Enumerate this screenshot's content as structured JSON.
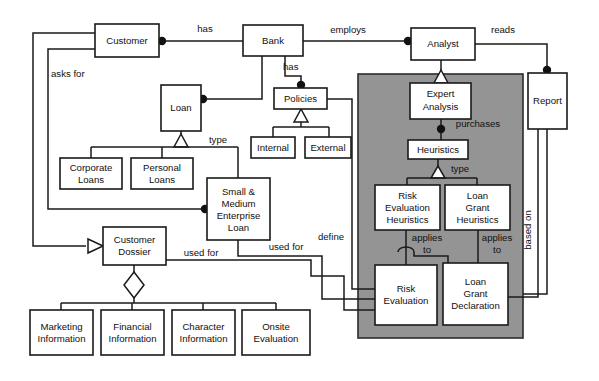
{
  "diagram": {
    "kind": "uml-class-diagram",
    "canvas": {
      "width": 599,
      "height": 381,
      "background": "#ffffff"
    },
    "colors": {
      "line": "#1a1a1a",
      "box_fill": "#ffffff",
      "grey_panel": "#949494",
      "shadow": "#8a8a8a"
    },
    "grey_panel": {
      "label": "expert-analysis-subsystem",
      "x": 358,
      "y": 74,
      "width": 165,
      "height": 264
    },
    "classes": [
      {
        "id": "customer",
        "label": "Customer",
        "lines": [
          "Customer"
        ],
        "x": 95,
        "y": 24,
        "w": 64,
        "h": 33
      },
      {
        "id": "bank",
        "label": "Bank",
        "lines": [
          "Bank"
        ],
        "x": 243,
        "y": 25,
        "w": 60,
        "h": 31
      },
      {
        "id": "analyst",
        "label": "Analyst",
        "lines": [
          "Analyst"
        ],
        "x": 411,
        "y": 28,
        "w": 64,
        "h": 32
      },
      {
        "id": "report",
        "label": "Report",
        "lines": [
          "Report"
        ],
        "x": 528,
        "y": 73,
        "w": 39,
        "h": 56
      },
      {
        "id": "loan",
        "label": "Loan",
        "lines": [
          "Loan"
        ],
        "x": 161,
        "y": 85,
        "w": 40,
        "h": 46
      },
      {
        "id": "policies",
        "label": "Policies",
        "lines": [
          "Policies"
        ],
        "x": 274,
        "y": 88,
        "w": 53,
        "h": 21
      },
      {
        "id": "internal",
        "label": "Internal",
        "lines": [
          "Internal"
        ],
        "x": 251,
        "y": 137,
        "w": 44,
        "h": 21
      },
      {
        "id": "external",
        "label": "External",
        "lines": [
          "External"
        ],
        "x": 305,
        "y": 137,
        "w": 46,
        "h": 21
      },
      {
        "id": "expert-analysis",
        "label": "Expert Analysis",
        "lines": [
          "Expert",
          "Analysis"
        ],
        "x": 410,
        "y": 83,
        "w": 61,
        "h": 36
      },
      {
        "id": "heuristics",
        "label": "Heuristics",
        "lines": [
          "Heuristics"
        ],
        "x": 408,
        "y": 140,
        "w": 60,
        "h": 19
      },
      {
        "id": "corporate-loans",
        "label": "Corporate Loans",
        "lines": [
          "Corporate",
          "Loans"
        ],
        "x": 60,
        "y": 158,
        "w": 62,
        "h": 31
      },
      {
        "id": "personal-loans",
        "label": "Personal Loans",
        "lines": [
          "Personal",
          "Loans"
        ],
        "x": 131,
        "y": 158,
        "w": 62,
        "h": 31
      },
      {
        "id": "sme-loan",
        "label": "Small & Medium Enterprise Loan",
        "lines": [
          "Small &",
          "Medium",
          "Enterprise",
          "Loan"
        ],
        "x": 207,
        "y": 178,
        "w": 63,
        "h": 62
      },
      {
        "id": "risk-eval-heuristics",
        "label": "Risk Evaluation Heuristics",
        "lines": [
          "Risk",
          "Evaluation",
          "Heuristics"
        ],
        "x": 375,
        "y": 185,
        "w": 65,
        "h": 45
      },
      {
        "id": "loan-grant-heuristics",
        "label": "Loan Grant Heuristics",
        "lines": [
          "Loan",
          "Grant",
          "Heuristics"
        ],
        "x": 445,
        "y": 185,
        "w": 65,
        "h": 45
      },
      {
        "id": "customer-dossier",
        "label": "Customer Dossier",
        "lines": [
          "Customer",
          "Dossier"
        ],
        "x": 103,
        "y": 227,
        "w": 63,
        "h": 38
      },
      {
        "id": "risk-evaluation",
        "label": "Risk Evaluation",
        "lines": [
          "Risk",
          "Evaluation"
        ],
        "x": 375,
        "y": 265,
        "w": 62,
        "h": 60
      },
      {
        "id": "loan-grant-declaration",
        "label": "Loan Grant Declaration",
        "lines": [
          "Loan",
          "Grant",
          "Declaration"
        ],
        "x": 443,
        "y": 263,
        "w": 65,
        "h": 62
      },
      {
        "id": "marketing-information",
        "label": "Marketing Information",
        "lines": [
          "Marketing",
          "Information"
        ],
        "x": 30,
        "y": 310,
        "w": 63,
        "h": 45
      },
      {
        "id": "financial-information",
        "label": "Financial Information",
        "lines": [
          "Financial",
          "Information"
        ],
        "x": 101,
        "y": 310,
        "w": 63,
        "h": 45
      },
      {
        "id": "character-information",
        "label": "Character Information",
        "lines": [
          "Character",
          "Information"
        ],
        "x": 172,
        "y": 310,
        "w": 63,
        "h": 45
      },
      {
        "id": "onsite-evaluation",
        "label": "Onsite Evaluation",
        "lines": [
          "Onsite",
          "Evaluation"
        ],
        "x": 242,
        "y": 310,
        "w": 68,
        "h": 45
      }
    ],
    "relationship_labels": [
      {
        "id": "has-customer-bank",
        "text": "has",
        "x": 205,
        "y": 29,
        "rotated": false
      },
      {
        "id": "employs",
        "text": "employs",
        "x": 348,
        "y": 30,
        "rotated": false
      },
      {
        "id": "reads",
        "text": "reads",
        "x": 503,
        "y": 30,
        "rotated": false
      },
      {
        "id": "asks-for",
        "text": "asks for",
        "x": 51,
        "y": 74,
        "rotated": false,
        "align": "left"
      },
      {
        "id": "has-bank-policies",
        "text": "has",
        "x": 290,
        "y": 67,
        "rotated": false
      },
      {
        "id": "purchases",
        "text": "purchases",
        "x": 478,
        "y": 124,
        "rotated": false
      },
      {
        "id": "type-loan",
        "text": "type",
        "x": 218,
        "y": 140,
        "rotated": false
      },
      {
        "id": "type-heuristics",
        "text": "type",
        "x": 456,
        "y": 172,
        "rotated": false
      },
      {
        "id": "applies-to-risk",
        "text": "applies to",
        "x": 425,
        "y": 243,
        "rotated": false,
        "multiline": [
          "applies",
          "to"
        ]
      },
      {
        "id": "applies-to-grant",
        "text": "applies to",
        "x": 497,
        "y": 243,
        "rotated": false,
        "multiline": [
          "applies",
          "to"
        ]
      },
      {
        "id": "define",
        "text": "define",
        "x": 331,
        "y": 237,
        "rotated": false
      },
      {
        "id": "used-for-sme",
        "text": "used for",
        "x": 283,
        "y": 247,
        "rotated": false
      },
      {
        "id": "used-for-dossier",
        "text": "used for",
        "x": 201,
        "y": 253,
        "rotated": false
      },
      {
        "id": "based-on",
        "text": "based on",
        "x": 528,
        "y": 230,
        "rotated": true
      }
    ]
  }
}
